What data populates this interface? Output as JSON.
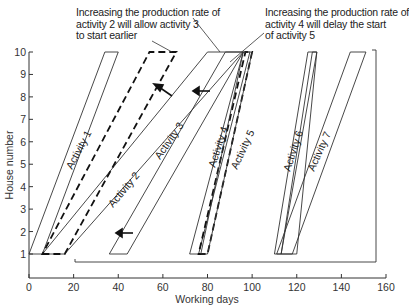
{
  "annotations": {
    "left_note": [
      "Increasing the production rate of",
      "activity 2 will allow activity 3",
      "to start earlier"
    ],
    "right_note": [
      "Increasing the production rate of",
      "activity 4 will delay the start",
      "of activity 5"
    ]
  },
  "caption": "Fig. 11.4 Line-of-balance schedule: impact of increasing production rates of activities",
  "chart_data": {
    "type": "line",
    "title": "",
    "xlabel": "Working days",
    "ylabel": "House number",
    "xlim": [
      0,
      160
    ],
    "ylim": [
      0,
      10
    ],
    "x_ticks": [
      "0",
      "20",
      "40",
      "60",
      "80",
      "100",
      "120",
      "140",
      "160"
    ],
    "y_ticks": [
      "1",
      "2",
      "3",
      "4",
      "5",
      "6",
      "7",
      "8",
      "9",
      "10"
    ],
    "grid": false,
    "series": [
      {
        "name": "Activity 1",
        "style": "solid",
        "start_house1": [
          0,
          6
        ],
        "finish_house10": [
          34,
          40
        ]
      },
      {
        "name": "Activity 2",
        "style": "solid",
        "start_house1": [
          6,
          16
        ],
        "finish_house10": [
          80,
          96
        ]
      },
      {
        "name": "Activity 2 (increased rate)",
        "style": "dashed",
        "start_house1": [
          6,
          16
        ],
        "finish_house10": [
          54,
          66
        ]
      },
      {
        "name": "Activity 3",
        "style": "solid",
        "start_house1": [
          36,
          44
        ],
        "finish_house10": [
          88,
          96
        ]
      },
      {
        "name": "Activity 4",
        "style": "solid",
        "start_house1": [
          72,
          76
        ],
        "finish_house10": [
          96,
          99
        ]
      },
      {
        "name": "Activity 4 (increased rate)",
        "style": "dashed",
        "start_house1": [
          76,
          80
        ],
        "finish_house10": [
          97,
          100
        ]
      },
      {
        "name": "Activity 5",
        "style": "solid",
        "start_house1": [
          77,
          80
        ],
        "finish_house10": [
          96,
          100
        ]
      },
      {
        "name": "Activity 6",
        "style": "solid",
        "start_house1": [
          110,
          113
        ],
        "finish_house10": [
          125,
          129
        ]
      },
      {
        "name": "Activity 7",
        "style": "solid",
        "start_house1": [
          113,
          120
        ],
        "finish_house10": [
          127,
          129
        ]
      },
      {
        "name": "Activity 8",
        "style": "solid",
        "start_house1": [
          145,
          152
        ],
        "finish_house10": [
          145,
          152
        ]
      }
    ],
    "bracket": {
      "from_x": 78,
      "to_x": 156,
      "y_house": 0.7,
      "up_to_house": 9.8
    }
  }
}
